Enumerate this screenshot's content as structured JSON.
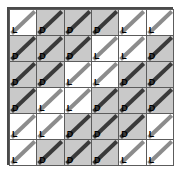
{
  "figure": {
    "rows": 6,
    "cols": 6,
    "colors": {
      "dark_cell": "#c9c9c9",
      "light_cell": "#ffffff",
      "grid_line": "#5c5c5c",
      "outer_border": "#4a4a4a",
      "diagonal_dark": "#3a3a3a",
      "diagonal_light": "#8c8c8c",
      "label_text": "#000000"
    },
    "legend": {
      "D": "dark shaded cell",
      "L": "light unshaded cell"
    },
    "diagonal_direction": "bottom-left to top-right"
  },
  "chart_data": {
    "type": "heatmap",
    "title": "",
    "xlabel": "",
    "ylabel": "",
    "rows": 6,
    "cols": 6,
    "cells": [
      [
        {
          "label": "L",
          "shade": "light"
        },
        {
          "label": "D",
          "shade": "dark"
        },
        {
          "label": "D",
          "shade": "dark"
        },
        {
          "label": "D",
          "shade": "dark"
        },
        {
          "label": "L",
          "shade": "light"
        },
        {
          "label": "L",
          "shade": "light"
        }
      ],
      [
        {
          "label": "D",
          "shade": "dark"
        },
        {
          "label": "D",
          "shade": "dark"
        },
        {
          "label": "D",
          "shade": "dark"
        },
        {
          "label": "L",
          "shade": "light"
        },
        {
          "label": "L",
          "shade": "light"
        },
        {
          "label": "D",
          "shade": "dark"
        }
      ],
      [
        {
          "label": "D",
          "shade": "dark"
        },
        {
          "label": "D",
          "shade": "dark"
        },
        {
          "label": "L",
          "shade": "light"
        },
        {
          "label": "L",
          "shade": "light"
        },
        {
          "label": "D",
          "shade": "dark"
        },
        {
          "label": "D",
          "shade": "dark"
        }
      ],
      [
        {
          "label": "D",
          "shade": "dark"
        },
        {
          "label": "L",
          "shade": "light"
        },
        {
          "label": "L",
          "shade": "light"
        },
        {
          "label": "D",
          "shade": "dark"
        },
        {
          "label": "D",
          "shade": "dark"
        },
        {
          "label": "D",
          "shade": "dark"
        }
      ],
      [
        {
          "label": "L",
          "shade": "light"
        },
        {
          "label": "L",
          "shade": "light"
        },
        {
          "label": "D",
          "shade": "dark"
        },
        {
          "label": "D",
          "shade": "dark"
        },
        {
          "label": "D",
          "shade": "dark"
        },
        {
          "label": "L",
          "shade": "light"
        }
      ],
      [
        {
          "label": "L",
          "shade": "light"
        },
        {
          "label": "D",
          "shade": "dark"
        },
        {
          "label": "D",
          "shade": "dark"
        },
        {
          "label": "D",
          "shade": "dark"
        },
        {
          "label": "L",
          "shade": "light"
        },
        {
          "label": "L",
          "shade": "light"
        }
      ]
    ]
  }
}
